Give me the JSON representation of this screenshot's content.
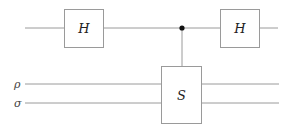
{
  "diagram": {
    "type": "quantum-circuit",
    "wires": [
      {
        "id": "q0",
        "label": "",
        "y": 28,
        "x_start": 25,
        "x_end": 278
      },
      {
        "id": "rho",
        "label": "ρ",
        "y": 84,
        "x_start": 25,
        "x_end": 279
      },
      {
        "id": "sigma",
        "label": "σ",
        "y": 103,
        "x_start": 25,
        "x_end": 279
      }
    ],
    "gates": [
      {
        "id": "h1",
        "label": "H",
        "wire": "q0",
        "x": 64,
        "y": 9,
        "w": 39,
        "h": 38
      },
      {
        "id": "s",
        "label": "S",
        "wires": [
          "rho",
          "sigma"
        ],
        "x": 161,
        "y": 66,
        "w": 40,
        "h": 57
      },
      {
        "id": "h2",
        "label": "H",
        "wire": "q0",
        "x": 220,
        "y": 9,
        "w": 39,
        "h": 38
      }
    ],
    "control": {
      "wire": "q0",
      "x": 182,
      "target": "s"
    },
    "colors": {
      "line": "#9a9a9a",
      "dot": "#111111",
      "text": "#222222"
    }
  }
}
